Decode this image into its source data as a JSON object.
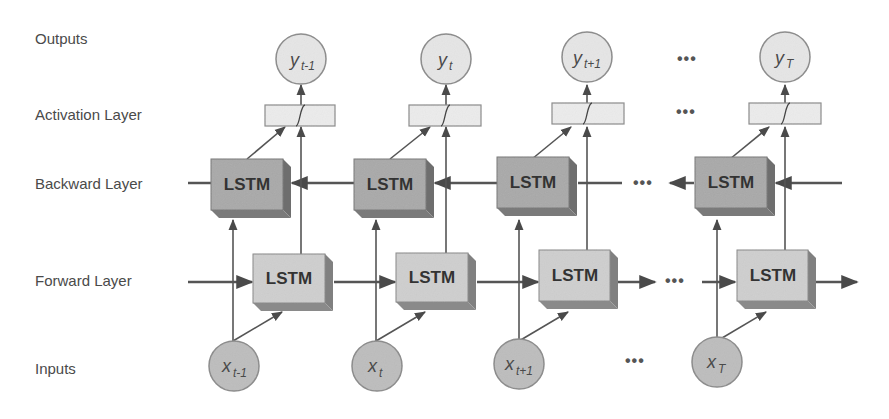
{
  "diagram": {
    "row_labels": {
      "outputs": "Outputs",
      "activation": "Activation Layer",
      "backward": "Backward Layer",
      "forward": "Forward Layer",
      "inputs": "Inputs"
    },
    "cell_label": "LSTM",
    "ellipsis": "•••",
    "columns": [
      {
        "output_main": "y",
        "output_sub": "t-1",
        "input_main": "x",
        "input_sub": "t-1"
      },
      {
        "output_main": "y",
        "output_sub": "t",
        "input_main": "x",
        "input_sub": "t"
      },
      {
        "output_main": "y",
        "output_sub": "t+1",
        "input_main": "x",
        "input_sub": "t+1"
      },
      {
        "output_main": "y",
        "output_sub": "T",
        "input_main": "x",
        "input_sub": "T"
      }
    ],
    "colors": {
      "backward_box": "#a9a9a9",
      "forward_box": "#cfcfcf",
      "box_side": "#7a7a7a",
      "node_fill": "#e6e6e6",
      "input_fill": "#bdbdbd",
      "activation_fill": "#ececec",
      "line": "#555555",
      "label_text": "#4a4a4a"
    }
  }
}
